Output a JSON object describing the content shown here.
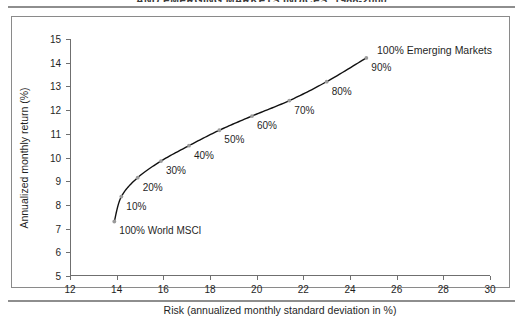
{
  "figure": {
    "title": "AND EMERGING MARKETS INDICES, 1988-2000"
  },
  "chart_data": {
    "type": "line",
    "title": "AND EMERGING MARKETS INDICES, 1988-2000",
    "xlabel": "Risk (annualized monthly standard deviation in %)",
    "ylabel": "Annualized monthly return (%)",
    "xlim": [
      12,
      30
    ],
    "ylim": [
      5,
      15
    ],
    "xticks": [
      12,
      14,
      16,
      18,
      20,
      22,
      24,
      26,
      28,
      30
    ],
    "yticks": [
      5,
      6,
      7,
      8,
      9,
      10,
      11,
      12,
      13,
      14,
      15
    ],
    "grid": false,
    "legend": "none",
    "series": [
      {
        "name": "Efficient frontier: World MSCI to Emerging Markets",
        "x": [
          13.9,
          14.2,
          14.9,
          15.9,
          17.1,
          18.4,
          19.8,
          21.4,
          23.0,
          24.7
        ],
        "y": [
          7.3,
          8.35,
          9.15,
          9.85,
          10.5,
          11.15,
          11.75,
          12.4,
          13.2,
          14.2
        ],
        "point_labels": [
          "100% World MSCI",
          "10%",
          "20%",
          "30%",
          "40%",
          "50%",
          "60%",
          "70%",
          "80%",
          "90%"
        ]
      }
    ],
    "annotations": [
      {
        "text": "100% Emerging Markets",
        "x": 24.7,
        "y": 14.2
      }
    ]
  }
}
